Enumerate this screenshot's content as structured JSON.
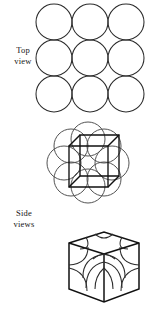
{
  "figure": {
    "kind": "crystal-structure-diagram",
    "background_color": "#ffffff",
    "stroke_color": "#1a1a1a",
    "width": 155,
    "height": 312
  },
  "labels": {
    "top_view": "Top\nview",
    "side_views": "Side\nviews"
  },
  "panels": {
    "top_view": {
      "name": "top-view-panel",
      "type": "circle-grid",
      "rows": 3,
      "columns": 3,
      "circle_count": 9,
      "circle_radius": 18,
      "packing": "square tangent",
      "origin": {
        "x": 36,
        "y": 4
      },
      "centers": [
        {
          "x": 54,
          "y": 22
        },
        {
          "x": 90,
          "y": 22
        },
        {
          "x": 126,
          "y": 22
        },
        {
          "x": 54,
          "y": 58
        },
        {
          "x": 90,
          "y": 58
        },
        {
          "x": 126,
          "y": 58
        },
        {
          "x": 54,
          "y": 94
        },
        {
          "x": 90,
          "y": 94
        },
        {
          "x": 126,
          "y": 94
        }
      ]
    },
    "side_view_spheres": {
      "name": "side-view-spheres-panel",
      "type": "cube-with-corner-spheres",
      "circle_count": 8,
      "circle_radius": 17,
      "centers": [
        {
          "x": 71,
          "y": 146
        },
        {
          "x": 104,
          "y": 146
        },
        {
          "x": 71,
          "y": 179
        },
        {
          "x": 104,
          "y": 179
        },
        {
          "x": 88,
          "y": 140
        },
        {
          "x": 88,
          "y": 186
        },
        {
          "x": 65,
          "y": 163
        },
        {
          "x": 111,
          "y": 163
        }
      ],
      "cube": {
        "front": [
          {
            "x": 69,
            "y": 146
          },
          {
            "x": 108,
            "y": 146
          },
          {
            "x": 108,
            "y": 187
          },
          {
            "x": 69,
            "y": 187
          }
        ],
        "back": [
          {
            "x": 80,
            "y": 135
          },
          {
            "x": 119,
            "y": 135
          },
          {
            "x": 119,
            "y": 176
          },
          {
            "x": 80,
            "y": 176
          }
        ]
      }
    },
    "side_view_cutaway": {
      "name": "side-view-cutaway-panel",
      "type": "cube-cutaway-octants",
      "projection": "hexagonal-isometric",
      "octant_arcs": 8,
      "outline": [
        {
          "x": 69,
          "y": 243
        },
        {
          "x": 104,
          "y": 232
        },
        {
          "x": 139,
          "y": 243
        },
        {
          "x": 139,
          "y": 289
        },
        {
          "x": 104,
          "y": 302
        },
        {
          "x": 69,
          "y": 289
        }
      ],
      "center": {
        "x": 104,
        "y": 266
      },
      "top_vertex": {
        "x": 104,
        "y": 254
      }
    }
  }
}
